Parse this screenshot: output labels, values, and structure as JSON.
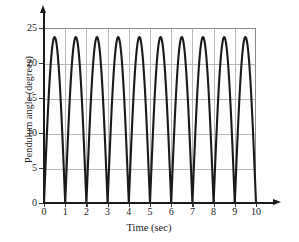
{
  "chart_data": {
    "type": "line",
    "title": "",
    "xlabel": "Time (sec)",
    "ylabel": "Pendulum angle (degrees)",
    "xlim": [
      0,
      10
    ],
    "ylim": [
      0,
      25
    ],
    "xticks": [
      0,
      1,
      2,
      3,
      4,
      5,
      6,
      7,
      8,
      9,
      10
    ],
    "xtick_labels": [
      "0",
      "1",
      "2",
      "3",
      "4",
      "5",
      "6",
      "7",
      "8",
      "9",
      "10"
    ],
    "yticks": [
      0,
      5,
      10,
      15,
      20,
      25
    ],
    "ytick_labels": [
      "0",
      "5",
      "10",
      "15",
      "20",
      "25"
    ],
    "grid": true,
    "grid_color": "#b9b9b9",
    "legend": null,
    "line_color": "#1a1a1a",
    "line_width": 2.1,
    "amplitude": 23.7,
    "period": 2,
    "peaks_x": [
      1,
      3,
      5,
      7,
      9
    ],
    "peaks_y": [
      23.7,
      23.7,
      23.7,
      23.7,
      23.7
    ],
    "zeros_x": [
      0,
      2,
      4,
      6,
      8,
      10
    ],
    "series": [
      {
        "name": "Pendulum angle",
        "x": [
          0,
          0.1,
          0.2,
          0.3,
          0.4,
          0.5,
          0.6,
          0.7,
          0.8,
          0.9,
          1,
          1.1,
          1.2,
          1.3,
          1.4,
          1.5,
          1.6,
          1.7,
          1.8,
          1.9,
          2,
          2.1,
          2.2,
          2.3,
          2.4,
          2.5,
          2.6,
          2.7,
          2.8,
          2.9,
          3,
          3.1,
          3.2,
          3.3,
          3.4,
          3.5,
          3.6,
          3.7,
          3.8,
          3.9,
          4,
          4.1,
          4.2,
          4.3,
          4.4,
          4.5,
          4.6,
          4.7,
          4.8,
          4.9,
          5,
          5.1,
          5.2,
          5.3,
          5.4,
          5.5,
          5.6,
          5.7,
          5.8,
          5.9,
          6,
          6.1,
          6.2,
          6.3,
          6.4,
          6.5,
          6.6,
          6.7,
          6.8,
          6.9,
          7,
          7.1,
          7.2,
          7.3,
          7.4,
          7.5,
          7.6,
          7.7,
          7.8,
          7.9,
          8,
          8.1,
          8.2,
          8.3,
          8.4,
          8.5,
          8.6,
          8.7,
          8.8,
          8.9,
          9,
          9.1,
          9.2,
          9.3,
          9.4,
          9.5,
          9.6,
          9.7,
          9.8,
          9.9,
          10
        ],
        "y": [
          0,
          3.66,
          7.23,
          10.6,
          13.93,
          16.76,
          19.17,
          21.12,
          22.54,
          23.41,
          23.7,
          23.41,
          22.54,
          21.12,
          19.17,
          16.76,
          13.93,
          10.6,
          7.23,
          3.66,
          0,
          3.66,
          7.23,
          10.6,
          13.93,
          16.76,
          19.17,
          21.12,
          22.54,
          23.41,
          23.7,
          23.41,
          22.54,
          21.12,
          19.17,
          16.76,
          13.93,
          10.6,
          7.23,
          3.66,
          0,
          3.66,
          7.23,
          10.6,
          13.93,
          16.76,
          19.17,
          21.12,
          22.54,
          23.41,
          23.7,
          23.41,
          22.54,
          21.12,
          19.17,
          16.76,
          13.93,
          10.6,
          7.23,
          3.66,
          0,
          3.66,
          7.23,
          10.6,
          13.93,
          16.76,
          19.17,
          21.12,
          22.54,
          23.41,
          23.7,
          23.41,
          22.54,
          21.12,
          19.17,
          16.76,
          13.93,
          10.6,
          7.23,
          3.66,
          0,
          3.66,
          7.23,
          10.6,
          13.93,
          16.76,
          19.17,
          21.12,
          22.54,
          23.41,
          23.7,
          23.41,
          22.54,
          21.12,
          19.17,
          16.76,
          13.93,
          10.6,
          7.23,
          3.66,
          0
        ]
      }
    ]
  }
}
